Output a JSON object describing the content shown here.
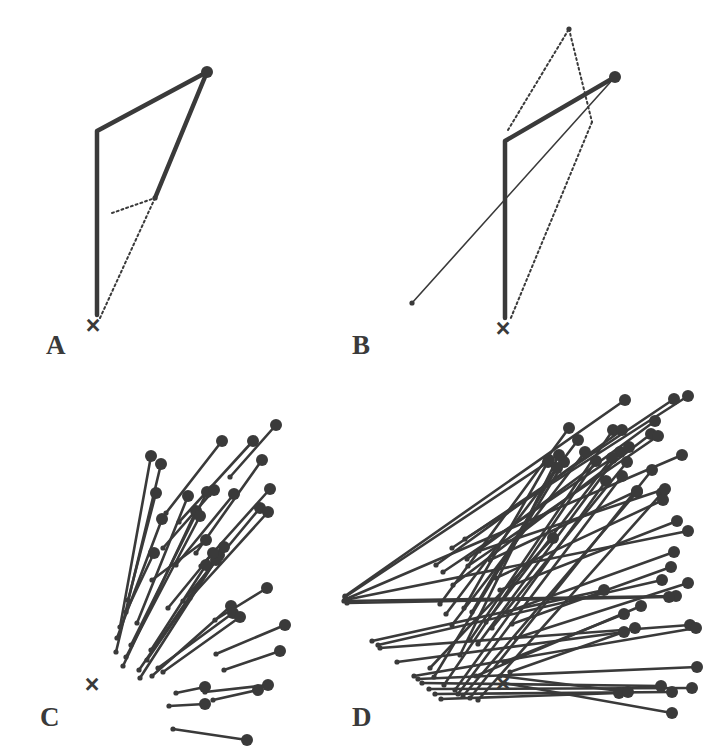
{
  "figure": {
    "background_color": "#ffffff",
    "ink_color": "#3a3a3a",
    "width": 719,
    "height": 750,
    "panels": [
      {
        "id": "A",
        "label": "A",
        "label_x": 46,
        "label_y": 354,
        "origin_marker": "x-marker",
        "origin_x": 93,
        "origin_y": 325
      },
      {
        "id": "B",
        "label": "B",
        "label_x": 352,
        "label_y": 354,
        "origin_marker": "x-marker",
        "origin_x": 503,
        "origin_y": 328
      },
      {
        "id": "C",
        "label": "C",
        "label_x": 40,
        "label_y": 726,
        "origin_marker": "x-marker",
        "origin_x": 92,
        "origin_y": 684
      },
      {
        "id": "D",
        "label": "D",
        "label_x": 352,
        "label_y": 726,
        "origin_marker": "x-marker",
        "origin_x": 503,
        "origin_y": 683
      }
    ]
  },
  "chart_data": {
    "type": "scatter",
    "xlabel": "",
    "ylabel": "",
    "legend": [],
    "grid": false,
    "styles": {
      "thick_stroke": 4.5,
      "medium_stroke": 2.6,
      "thin_stroke": 1.6,
      "dotted_stroke": 2.0,
      "dot_large_r": 6.0,
      "dot_small_r": 2.6,
      "dash_pattern": "2,3"
    },
    "panels": [
      {
        "id": "A",
        "origin": [
          93,
          325
        ],
        "solid_paths": [
          {
            "points": [
              [
                97,
                315
              ],
              [
                97,
                131
              ],
              [
                207,
                72
              ]
            ],
            "width": "thick",
            "end_dot": "large"
          },
          {
            "points": [
              [
                207,
                72
              ],
              [
                155,
                198
              ]
            ],
            "width": "thick",
            "end_dot": "none"
          }
        ],
        "dotted_paths": [
          {
            "points": [
              [
                112,
                213
              ],
              [
                155,
                198
              ]
            ]
          },
          {
            "points": [
              [
                155,
                198
              ],
              [
                100,
                318
              ]
            ]
          }
        ],
        "large_dots": [
          [
            207,
            72
          ]
        ],
        "small_dots": [
          [
            155,
            198
          ]
        ]
      },
      {
        "id": "B",
        "origin": [
          503,
          328
        ],
        "solid_paths": [
          {
            "points": [
              [
                505,
                318
              ],
              [
                505,
                141
              ],
              [
                615,
                77
              ]
            ],
            "width": "thick",
            "end_dot": "large"
          },
          {
            "points": [
              [
                412,
                303
              ],
              [
                615,
                77
              ]
            ],
            "width": "thin",
            "end_dot": "none"
          }
        ],
        "dotted_paths": [
          {
            "points": [
              [
                508,
                130
              ],
              [
                569,
                29
              ]
            ]
          },
          {
            "points": [
              [
                569,
                29
              ],
              [
                592,
                122
              ]
            ]
          },
          {
            "points": [
              [
                592,
                122
              ],
              [
                510,
                320
              ]
            ]
          }
        ],
        "large_dots": [
          [
            615,
            77
          ]
        ],
        "small_dots": [
          [
            569,
            29
          ],
          [
            412,
            303
          ]
        ]
      },
      {
        "id": "C",
        "origin": [
          92,
          684
        ],
        "segments": [
          [
            [
              120,
              627
            ],
            [
              151,
              456
            ]
          ],
          [
            [
              116,
              652
            ],
            [
              161,
              464
            ]
          ],
          [
            [
              117,
              638
            ],
            [
              162,
              519
            ]
          ],
          [
            [
              126,
              612
            ],
            [
              154,
              553
            ]
          ],
          [
            [
              123,
              666
            ],
            [
              196,
              511
            ]
          ],
          [
            [
              126,
              657
            ],
            [
              200,
              516
            ]
          ],
          [
            [
              131,
              645
            ],
            [
              207,
              492
            ]
          ],
          [
            [
              128,
              600
            ],
            [
              156,
              493
            ]
          ],
          [
            [
              137,
              623
            ],
            [
              188,
              496
            ]
          ],
          [
            [
              140,
              678
            ],
            [
              219,
              555
            ]
          ],
          [
            [
              139,
              670
            ],
            [
              224,
              547
            ]
          ],
          [
            [
              147,
              660
            ],
            [
              216,
              560
            ]
          ],
          [
            [
              151,
              650
            ],
            [
              206,
              565
            ]
          ],
          [
            [
              152,
              676
            ],
            [
              231,
              606
            ]
          ],
          [
            [
              158,
              668
            ],
            [
              233,
              613
            ]
          ],
          [
            [
              163,
              672
            ],
            [
              240,
              617
            ]
          ],
          [
            [
              168,
              608
            ],
            [
              213,
              553
            ]
          ],
          [
            [
              176,
              565
            ],
            [
              234,
              494
            ]
          ],
          [
            [
              163,
              548
            ],
            [
              214,
              490
            ]
          ],
          [
            [
              183,
              601
            ],
            [
              260,
              508
            ]
          ],
          [
            [
              190,
              598
            ],
            [
              268,
              512
            ]
          ],
          [
            [
              166,
              513
            ],
            [
              222,
              441
            ]
          ],
          [
            [
              179,
              522
            ],
            [
              253,
              441
            ]
          ],
          [
            [
              196,
              553
            ],
            [
              262,
              460
            ]
          ],
          [
            [
              201,
              566
            ],
            [
              270,
              489
            ]
          ],
          [
            [
              215,
              620
            ],
            [
              267,
              588
            ]
          ],
          [
            [
              216,
              654
            ],
            [
              285,
              625
            ]
          ],
          [
            [
              224,
              670
            ],
            [
              280,
              651
            ]
          ],
          [
            [
              205,
              692
            ],
            [
              268,
              685
            ]
          ],
          [
            [
              213,
              700
            ],
            [
              258,
              690
            ]
          ],
          [
            [
              176,
              693
            ],
            [
              205,
              687
            ]
          ],
          [
            [
              169,
              706
            ],
            [
              205,
              704
            ]
          ],
          [
            [
              173,
              729
            ],
            [
              247,
              740
            ]
          ],
          [
            [
              230,
              477
            ],
            [
              276,
              425
            ]
          ],
          [
            [
              152,
              580
            ],
            [
              206,
              540
            ]
          ]
        ],
        "large_dot_at": "end",
        "small_dot_at": "start"
      },
      {
        "id": "D",
        "origin": [
          503,
          683
        ],
        "segments": [
          [
            [
              345,
              596
            ],
            [
              625,
              400
            ]
          ],
          [
            [
              345,
              597
            ],
            [
              548,
              462
            ]
          ],
          [
            [
              346,
              599
            ],
            [
              682,
              455
            ]
          ],
          [
            [
              345,
              600
            ],
            [
              688,
              531
            ]
          ],
          [
            [
              344,
              601
            ],
            [
              676,
              596
            ]
          ],
          [
            [
              347,
              603
            ],
            [
              669,
              597
            ]
          ],
          [
            [
              372,
              641
            ],
            [
              604,
              590
            ]
          ],
          [
            [
              378,
              645
            ],
            [
              662,
              580
            ]
          ],
          [
            [
              380,
              648
            ],
            [
              690,
              625
            ]
          ],
          [
            [
              397,
              662
            ],
            [
              624,
              632
            ]
          ],
          [
            [
              414,
              676
            ],
            [
              696,
              628
            ]
          ],
          [
            [
              418,
              679
            ],
            [
              697,
              667
            ]
          ],
          [
            [
              422,
              683
            ],
            [
              661,
              686
            ]
          ],
          [
            [
              429,
              689
            ],
            [
              692,
              688
            ]
          ],
          [
            [
              435,
              694
            ],
            [
              672,
              692
            ]
          ],
          [
            [
              441,
              699
            ],
            [
              619,
              693
            ]
          ],
          [
            [
              430,
              668
            ],
            [
              553,
              538
            ]
          ],
          [
            [
              434,
              677
            ],
            [
              564,
              462
            ]
          ],
          [
            [
              444,
              685
            ],
            [
              596,
              461
            ]
          ],
          [
            [
              455,
              690
            ],
            [
              606,
              481
            ]
          ],
          [
            [
              458,
              694
            ],
            [
              622,
              476
            ]
          ],
          [
            [
              463,
              696
            ],
            [
              637,
              492
            ]
          ],
          [
            [
              470,
              698
            ],
            [
              652,
              470
            ]
          ],
          [
            [
              478,
              700
            ],
            [
              662,
              493
            ]
          ],
          [
            [
              460,
              655
            ],
            [
              559,
              455
            ]
          ],
          [
            [
              470,
              640
            ],
            [
              613,
              430
            ]
          ],
          [
            [
              478,
              644
            ],
            [
              620,
              452
            ]
          ],
          [
            [
              464,
              608
            ],
            [
              549,
              460
            ]
          ],
          [
            [
              472,
              612
            ],
            [
              557,
              468
            ]
          ],
          [
            [
              486,
              622
            ],
            [
              612,
              458
            ]
          ],
          [
            [
              492,
              628
            ],
            [
              627,
              462
            ]
          ],
          [
            [
              436,
              565
            ],
            [
              622,
              430
            ]
          ],
          [
            [
              443,
              572
            ],
            [
              629,
              447
            ]
          ],
          [
            [
              453,
              585
            ],
            [
              651,
              434
            ]
          ],
          [
            [
              468,
              566
            ],
            [
              658,
              436
            ]
          ],
          [
            [
              467,
              559
            ],
            [
              655,
              421
            ]
          ],
          [
            [
              452,
              548
            ],
            [
              674,
              399
            ]
          ],
          [
            [
              465,
              539
            ],
            [
              688,
              396
            ]
          ],
          [
            [
              479,
              551
            ],
            [
              665,
              489
            ]
          ],
          [
            [
              490,
              560
            ],
            [
              637,
              491
            ]
          ],
          [
            [
              496,
              578
            ],
            [
              663,
              500
            ]
          ],
          [
            [
              500,
              590
            ],
            [
              677,
              521
            ]
          ],
          [
            [
              507,
              612
            ],
            [
              674,
              552
            ]
          ],
          [
            [
              512,
              624
            ],
            [
              671,
              567
            ]
          ],
          [
            [
              516,
              638
            ],
            [
              688,
              583
            ]
          ],
          [
            [
              504,
              662
            ],
            [
              624,
              614
            ]
          ],
          [
            [
              510,
              672
            ],
            [
              635,
              628
            ]
          ],
          [
            [
              500,
              676
            ],
            [
              628,
              692
            ]
          ],
          [
            [
              504,
              683
            ],
            [
              672,
              713
            ]
          ],
          [
            [
              452,
              625
            ],
            [
              585,
              452
            ]
          ],
          [
            [
              446,
              614
            ],
            [
              578,
              440
            ]
          ],
          [
            [
              440,
              604
            ],
            [
              569,
              428
            ]
          ],
          [
            [
              476,
              676
            ],
            [
              641,
              606
            ]
          ]
        ],
        "large_dot_at": "end",
        "small_dot_at": "start"
      }
    ]
  }
}
